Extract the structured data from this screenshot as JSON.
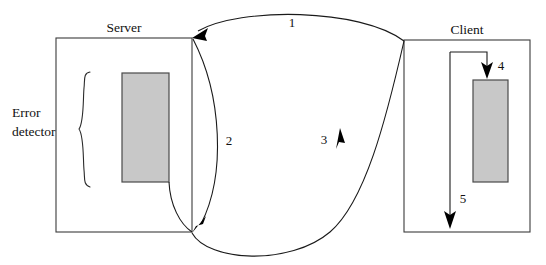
{
  "diagram": {
    "type": "sequence-flow-diagram",
    "background_color": "#ffffff",
    "line_color": "#1a1a1a",
    "block_fill_color": "#c8c8c8",
    "nodes": [
      {
        "id": "server",
        "title": "Server",
        "box": {
          "x": 56,
          "y": 38,
          "width": 136,
          "height": 194
        },
        "block": {
          "x": 122,
          "y": 73,
          "width": 47,
          "height": 109
        }
      },
      {
        "id": "client",
        "title": "Client",
        "box": {
          "x": 404,
          "y": 40,
          "width": 126,
          "height": 192
        },
        "block": {
          "x": 473,
          "y": 80,
          "width": 35,
          "height": 102
        }
      }
    ],
    "annotations": [
      {
        "id": "error-detector",
        "text_line1": "Error",
        "text_line2": "detector"
      }
    ],
    "steps": [
      {
        "id": "step-1",
        "label": "1",
        "from": "client",
        "to": "server",
        "description": "client top to server top"
      },
      {
        "id": "step-2",
        "label": "2",
        "from": "server-block",
        "to": "server-bottom",
        "description": "server internal down"
      },
      {
        "id": "step-3",
        "label": "3",
        "from": "server",
        "to": "client",
        "description": "server bottom to client bottom"
      },
      {
        "id": "step-4",
        "label": "4",
        "from": "client-top",
        "to": "client-block",
        "description": "client into block"
      },
      {
        "id": "step-5",
        "label": "5",
        "from": "client-top",
        "to": "client-bottom",
        "description": "client down"
      }
    ]
  }
}
